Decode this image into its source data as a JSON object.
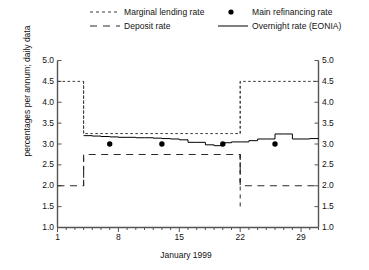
{
  "legend": {
    "items": [
      {
        "key": "marginal-lending-rate",
        "label": "Marginal lending rate",
        "style": "dotted",
        "color": "#3a3a3a"
      },
      {
        "key": "deposit-rate",
        "label": "Deposit rate",
        "style": "dashed",
        "color": "#2a2a2a"
      },
      {
        "key": "main-refinancing-rate",
        "label": "Main refinancing rate",
        "style": "marker",
        "color": "#000000"
      },
      {
        "key": "overnight-rate-eonia",
        "label": "Overnight rate (EONIA)",
        "style": "solid",
        "color": "#000000"
      }
    ]
  },
  "axes": {
    "y_title": "percentages per annum; daily data",
    "x_title": "January 1999",
    "y_ticks": [
      "5.0",
      "4.5",
      "4.0",
      "3.5",
      "3.0",
      "2.5",
      "2.0",
      "1.5",
      "1.0"
    ],
    "x_ticks": [
      "1",
      "8",
      "15",
      "22",
      "29"
    ]
  },
  "chart_data": {
    "type": "line",
    "title": "",
    "subtitle": "",
    "xlabel": "January 1999",
    "ylabel": "percentages per annum; daily data",
    "xlim": [
      1,
      31
    ],
    "ylim": [
      1.0,
      5.0
    ],
    "ytick_values": [
      5.0,
      4.5,
      4.0,
      3.5,
      3.0,
      2.5,
      2.0,
      1.5,
      1.0
    ],
    "xtick_values": [
      1,
      8,
      15,
      22,
      29
    ],
    "grid": false,
    "legend_position": "top",
    "series": [
      {
        "name": "Marginal lending rate",
        "style": "dotted",
        "color": "#3a3a3a",
        "step": true,
        "x": [
          1,
          2,
          3,
          4,
          5,
          6,
          7,
          8,
          9,
          10,
          11,
          12,
          13,
          14,
          15,
          16,
          17,
          18,
          19,
          20,
          21,
          22,
          23,
          24,
          25,
          26,
          27,
          28,
          29,
          30,
          31
        ],
        "values": [
          4.5,
          4.5,
          4.5,
          3.25,
          3.25,
          3.25,
          3.25,
          3.25,
          3.25,
          3.25,
          3.25,
          3.25,
          3.25,
          3.25,
          3.25,
          3.25,
          3.25,
          3.25,
          3.25,
          3.25,
          3.25,
          4.5,
          4.5,
          4.5,
          4.5,
          4.5,
          4.5,
          4.5,
          4.5,
          4.5,
          4.5
        ]
      },
      {
        "name": "Deposit rate",
        "style": "dashed",
        "color": "#2a2a2a",
        "step": true,
        "x": [
          1,
          2,
          3,
          4,
          5,
          6,
          7,
          8,
          9,
          10,
          11,
          12,
          13,
          14,
          15,
          16,
          17,
          18,
          19,
          20,
          21,
          22,
          23,
          24,
          25,
          26,
          27,
          28,
          29,
          30,
          31
        ],
        "values": [
          2.0,
          2.0,
          2.0,
          2.75,
          2.75,
          2.75,
          2.75,
          2.75,
          2.75,
          2.75,
          2.75,
          2.75,
          2.75,
          2.75,
          2.75,
          2.75,
          2.75,
          2.75,
          2.75,
          2.75,
          2.75,
          2.0,
          2.0,
          2.0,
          2.0,
          2.0,
          2.0,
          2.0,
          2.0,
          2.0,
          2.0
        ]
      },
      {
        "name": "Overnight rate (EONIA)",
        "style": "solid",
        "color": "#000000",
        "step": true,
        "x": [
          4,
          5,
          6,
          7,
          8,
          9,
          10,
          11,
          12,
          13,
          14,
          15,
          16,
          17,
          18,
          19,
          20,
          21,
          22,
          23,
          24,
          25,
          26,
          27,
          28,
          29,
          30,
          31
        ],
        "values": [
          3.2,
          3.19,
          3.18,
          3.17,
          3.16,
          3.16,
          3.15,
          3.15,
          3.14,
          3.13,
          3.12,
          3.1,
          3.04,
          3.04,
          2.98,
          2.96,
          3.03,
          3.05,
          3.05,
          3.08,
          3.12,
          3.12,
          3.24,
          3.24,
          3.12,
          3.12,
          3.13,
          3.13
        ]
      },
      {
        "name": "Main refinancing rate",
        "style": "marker",
        "color": "#000000",
        "x": [
          7,
          13,
          20,
          26
        ],
        "values": [
          3.0,
          3.0,
          3.0,
          3.0
        ]
      }
    ]
  }
}
